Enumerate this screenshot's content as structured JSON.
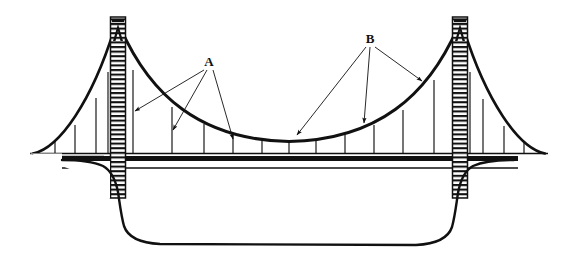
{
  "figure": {
    "background_color": "#ffffff",
    "ink_color": "#111111",
    "width": 578,
    "height": 259
  },
  "labels": [
    {
      "id": "label-a",
      "text": "A",
      "x": 209,
      "y": 62,
      "refers_to": "vertical suspender cables (hangers)",
      "arrow_count": 3
    },
    {
      "id": "label-b",
      "text": "B",
      "x": 370,
      "y": 39,
      "refers_to": "main suspension cable",
      "arrow_count": 3
    }
  ],
  "leader_lines": {
    "a_arrows": [
      {
        "from_x": 205,
        "from_y": 68,
        "to_x": 133,
        "to_y": 111
      },
      {
        "from_x": 207,
        "from_y": 68,
        "to_x": 172,
        "to_y": 131
      },
      {
        "from_x": 212,
        "from_y": 68,
        "to_x": 233,
        "to_y": 140
      }
    ],
    "b_arrows": [
      {
        "from_x": 367,
        "from_y": 45,
        "to_x": 296,
        "to_y": 136
      },
      {
        "from_x": 371,
        "from_y": 45,
        "to_x": 363,
        "to_y": 124
      },
      {
        "from_x": 375,
        "from_y": 45,
        "to_x": 423,
        "to_y": 82
      }
    ]
  },
  "structure": {
    "towers": [
      {
        "name": "left-tower",
        "center_x": 118,
        "top_y": 17,
        "bottom_y": 198,
        "width": 15,
        "rung_count": 34
      },
      {
        "name": "right-tower",
        "center_x": 460,
        "top_y": 17,
        "bottom_y": 198,
        "width": 15,
        "rung_count": 34
      }
    ],
    "deck": {
      "top_y": 153,
      "thick_band_y": 157,
      "thick_band_height": 5,
      "lower_line_y": 168,
      "left_x": 30,
      "right_x": 548
    },
    "main_cable": {
      "left_anchor": {
        "x": 33,
        "y": 153
      },
      "left_tower_top": {
        "x": 118,
        "y": 27
      },
      "mid_sag": {
        "x": 289,
        "y": 142
      },
      "right_tower_top": {
        "x": 460,
        "y": 27
      },
      "right_anchor": {
        "x": 545,
        "y": 153
      }
    },
    "suspenders": {
      "main_span_count": 11,
      "left_side_span_count": 3,
      "right_side_span_count": 3,
      "main_span_x_positions": [
        133,
        172,
        204,
        233,
        262,
        289,
        316,
        345,
        374,
        403,
        434
      ],
      "left_side_span_x_positions": [
        55,
        75,
        96
      ],
      "right_side_span_x_positions": [
        483,
        504,
        524
      ]
    },
    "channel_bed": {
      "name": "water-channel-profile",
      "left_start_x": 100,
      "right_end_x": 478,
      "deepest_y": 243
    }
  },
  "legend_note": {
    "a_meaning": "A",
    "b_meaning": "B"
  }
}
